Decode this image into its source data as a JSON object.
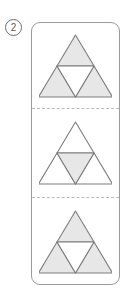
{
  "label": {
    "icon": "circled-number-icon",
    "text": "2"
  },
  "colors": {
    "shaded_fill": "#e7e7e7",
    "unshaded_fill": "#ffffff",
    "stroke": "#7d7d7d",
    "container_border": "#9b9b9b",
    "separator": "#b9b9b9",
    "background": "#ffffff"
  },
  "figure": {
    "type": "subdivided-triangle-sequence",
    "panel_count": 3,
    "separator_style": "dashed",
    "panels": [
      {
        "name": "panel-one",
        "shape": "sierpinski-stage-1",
        "parts": [
          {
            "name": "top-sub-triangle",
            "orientation": "up",
            "shaded": true
          },
          {
            "name": "bottom-left-sub-triangle",
            "orientation": "up",
            "shaded": true
          },
          {
            "name": "bottom-right-sub-triangle",
            "orientation": "up",
            "shaded": true
          },
          {
            "name": "center-sub-triangle",
            "orientation": "down",
            "shaded": false
          }
        ],
        "shaded_count": 3
      },
      {
        "name": "panel-two",
        "shape": "sierpinski-stage-1",
        "parts": [
          {
            "name": "top-sub-triangle",
            "orientation": "up",
            "shaded": false
          },
          {
            "name": "bottom-left-sub-triangle",
            "orientation": "up",
            "shaded": false
          },
          {
            "name": "bottom-right-sub-triangle",
            "orientation": "up",
            "shaded": false
          },
          {
            "name": "center-sub-triangle",
            "orientation": "down",
            "shaded": true
          }
        ],
        "shaded_count": 1
      },
      {
        "name": "panel-three",
        "shape": "sierpinski-stage-1",
        "parts": [
          {
            "name": "top-sub-triangle",
            "orientation": "up",
            "shaded": true
          },
          {
            "name": "bottom-left-sub-triangle",
            "orientation": "up",
            "shaded": true
          },
          {
            "name": "bottom-right-sub-triangle",
            "orientation": "up",
            "shaded": true
          },
          {
            "name": "center-sub-triangle",
            "orientation": "down",
            "shaded": false
          }
        ],
        "shaded_count": 3
      }
    ]
  }
}
